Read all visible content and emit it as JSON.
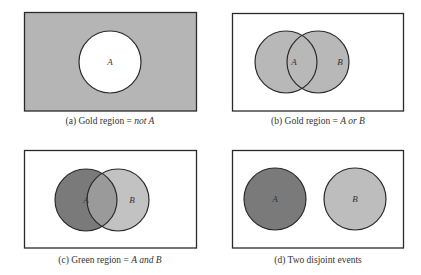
{
  "figure": {
    "panels": [
      {
        "id": "a",
        "caption_prefix": "(a) Gold region = ",
        "caption_emph": "not A",
        "caption_suffix": "",
        "circles": [
          {
            "label": "A",
            "cx": 110,
            "cy": 62,
            "r": 31,
            "fill": "#ffffff"
          }
        ],
        "box_fill": "#b5b5b5"
      },
      {
        "id": "b",
        "caption_prefix": "(b) Gold region = ",
        "caption_emph": "A or B",
        "caption_suffix": "",
        "circles": [
          {
            "label": "A",
            "cx": 286,
            "cy": 62,
            "r": 31,
            "fill": "#b8b8b8"
          },
          {
            "label": "B",
            "cx": 318,
            "cy": 62,
            "r": 31,
            "fill": "#b8b8b8"
          }
        ],
        "box_fill": "#ffffff"
      },
      {
        "id": "c",
        "caption_prefix": "(c) Green region = ",
        "caption_emph": "A and B",
        "caption_suffix": "",
        "circles": [
          {
            "label": "A",
            "cx": 86,
            "cy": 200,
            "r": 31,
            "fill": "#7a7a7a"
          },
          {
            "label": "B",
            "cx": 118,
            "cy": 200,
            "r": 31,
            "fill": "#c2c2c2"
          }
        ],
        "overlap_fill": "#9a9a9a",
        "box_fill": "#ffffff"
      },
      {
        "id": "d",
        "caption_prefix": "(d) Two disjoint events",
        "caption_emph": "",
        "caption_suffix": "",
        "circles": [
          {
            "label": "A",
            "cx": 275,
            "cy": 199,
            "r": 31,
            "fill": "#7a7a7a"
          },
          {
            "label": "B",
            "cx": 355,
            "cy": 199,
            "r": 31,
            "fill": "#bdbdbd"
          }
        ],
        "box_fill": "#ffffff"
      }
    ],
    "colors": {
      "stroke": "#2a2a2a",
      "label": "#333333"
    }
  }
}
